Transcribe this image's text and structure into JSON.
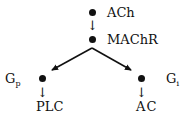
{
  "diagram": {
    "type": "signaling-pathway",
    "nodes": [
      {
        "id": "ach",
        "label": "ACh"
      },
      {
        "id": "machr",
        "label": "MAChR"
      },
      {
        "id": "gp",
        "label": "G",
        "subscript": "p"
      },
      {
        "id": "gi",
        "label": "G",
        "subscript": "i"
      },
      {
        "id": "plc",
        "label": "PLC"
      },
      {
        "id": "ac",
        "label": "AC"
      }
    ],
    "edges": [
      {
        "from": "ach",
        "to": "machr",
        "style": "small-arrow"
      },
      {
        "from": "machr",
        "to": "gp",
        "style": "bold-arrow"
      },
      {
        "from": "machr",
        "to": "gi",
        "style": "bold-arrow"
      },
      {
        "from": "gp",
        "to": "plc",
        "style": "small-arrow"
      },
      {
        "from": "gi",
        "to": "ac",
        "style": "small-arrow"
      }
    ],
    "arrow_glyph": "↓"
  }
}
